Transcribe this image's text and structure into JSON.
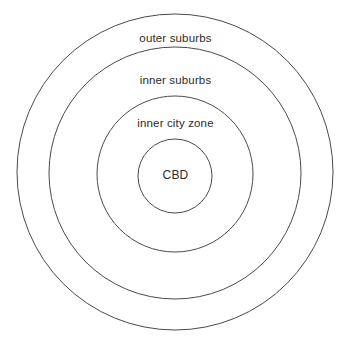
{
  "diagram": {
    "type": "concentric-circles",
    "title": "",
    "background_color": "#ffffff",
    "stroke_color": "#4a4a4a",
    "text_color": "#2b2b2b",
    "zones": [
      {
        "id": "outer-suburbs",
        "label": "outer suburbs",
        "order": 1,
        "center_x": 175,
        "center_y": 172,
        "radius": 158
      },
      {
        "id": "inner-suburbs",
        "label": "inner suburbs",
        "order": 2,
        "center_x": 175,
        "center_y": 173,
        "radius": 126
      },
      {
        "id": "inner-city-zone",
        "label": "inner city zone",
        "order": 3,
        "center_x": 175,
        "center_y": 174,
        "radius": 78
      },
      {
        "id": "cbd",
        "label": "CBD",
        "order": 4,
        "center_x": 175,
        "center_y": 176,
        "radius": 37
      }
    ]
  }
}
